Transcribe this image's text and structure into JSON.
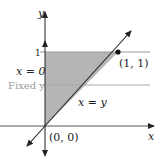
{
  "diagram": {
    "type": "region-of-integration",
    "axes": {
      "x_label": "x",
      "y_label": "y",
      "y_tick": "1"
    },
    "region": {
      "description": "triangle bounded by x = 0, y = 1, and x = y",
      "fill": "#b5b5b5"
    },
    "lines": {
      "left_boundary": "x = 0",
      "diagonal": "x = y",
      "fixed_line": "Fixed y"
    },
    "points": [
      {
        "label": "(0, 0)"
      },
      {
        "label": "(1, 1)"
      }
    ],
    "colors": {
      "axis": "#222222",
      "region": "#b5b5b5",
      "fixed_line": "#aaaaaa",
      "top_line": "#999999"
    }
  }
}
